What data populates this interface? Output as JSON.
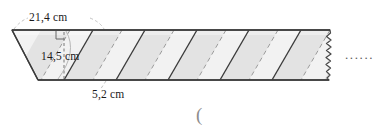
{
  "figure": {
    "type": "geometry-diagram",
    "shape": "parallelogram-strip",
    "labels": {
      "slant_side": "21,4 cm",
      "height": "14,5 cm",
      "base": "5,2 cm"
    },
    "measurements": [
      {
        "name": "slant-side",
        "value": "21,4",
        "unit": "cm"
      },
      {
        "name": "height",
        "value": "14,5",
        "unit": "cm"
      },
      {
        "name": "base",
        "value": "5,2",
        "unit": "cm"
      }
    ],
    "continuation": {
      "ellipsis": "......",
      "torn_edge": "wavy"
    },
    "annotation": {
      "paren": "("
    },
    "colors": {
      "outline": "#4a4a4a",
      "fill_light": "#f0f0f0",
      "fill_band": "#d8d8d8",
      "stripe_solid": "#3c3c3c",
      "stripe_dashed": "#9a9a9a",
      "leader_line": "#aaaaaa",
      "text": "#1a1a1a",
      "background": "#ffffff"
    }
  }
}
